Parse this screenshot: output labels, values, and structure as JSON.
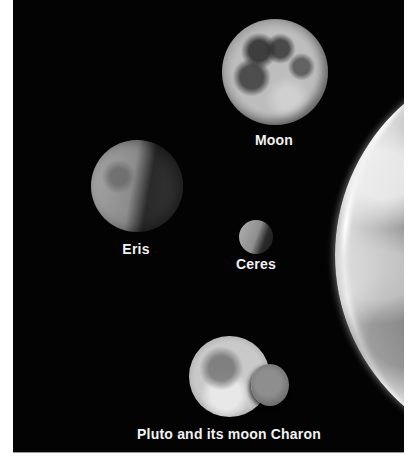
{
  "image": {
    "description": "Size comparison of dwarf planets and moons against Earth on a black space background",
    "background_color": "#030303",
    "frame_color": "#ffffff"
  },
  "bodies": [
    {
      "id": "moon",
      "label": "Moon"
    },
    {
      "id": "eris",
      "label": "Eris"
    },
    {
      "id": "ceres",
      "label": "Ceres"
    },
    {
      "id": "pluto-charon",
      "label": "Pluto and its moon Charon"
    },
    {
      "id": "earth",
      "label": ""
    }
  ],
  "labels": {
    "moon": "Moon",
    "eris": "Eris",
    "ceres": "Ceres",
    "pluto": "Pluto and its moon Charon"
  }
}
